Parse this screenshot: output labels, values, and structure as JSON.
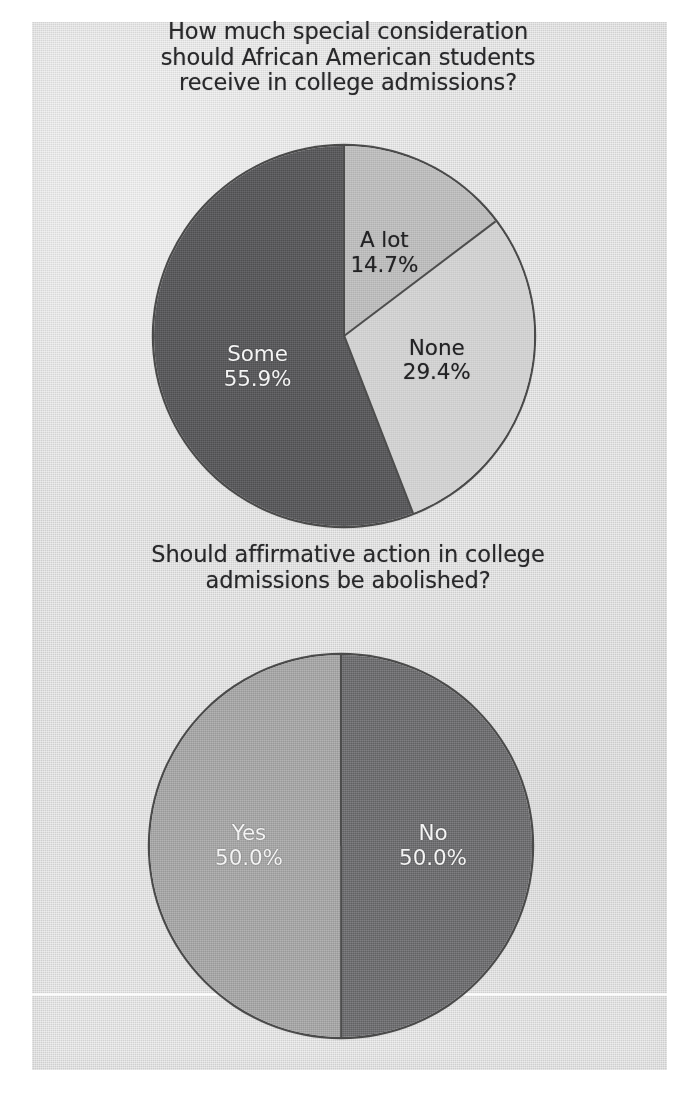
{
  "page": {
    "background_color": "#ffffff",
    "panel_color": "#d9d9d9"
  },
  "chart_data": [
    {
      "type": "pie",
      "id": "college-consideration",
      "title": "How much special consideration\nshould African American students\nreceive in college admissions?",
      "categories": [
        "A lot",
        "None",
        "Some"
      ],
      "values": [
        14.7,
        29.4,
        55.9
      ],
      "value_labels": [
        "14.7%",
        "29.4%",
        "55.9%"
      ],
      "colors": [
        "#b9b9b9",
        "#cfcfcf",
        "#575759"
      ],
      "label_text_colors": [
        "#222224",
        "#222224",
        "#f4f4f4"
      ],
      "start_angle_deg": 0,
      "direction": "clockwise",
      "legend": "none",
      "labels_inside": true,
      "slices": [
        {
          "name": "A lot",
          "value": 14.7,
          "value_label": "14.7%",
          "color": "#b9b9b9"
        },
        {
          "name": "None",
          "value": 29.4,
          "value_label": "29.4%",
          "color": "#cfcfcf"
        },
        {
          "name": "Some",
          "value": 55.9,
          "value_label": "55.9%",
          "color": "#575759"
        }
      ]
    },
    {
      "type": "pie",
      "id": "abolish-affirmative-action",
      "title": "Should affirmative action in college\nadmissions be abolished?",
      "categories": [
        "No",
        "Yes"
      ],
      "values": [
        50.0,
        50.0
      ],
      "value_labels": [
        "50.0%",
        "50.0%"
      ],
      "colors": [
        "#6b6b6d",
        "#a2a2a2"
      ],
      "label_text_colors": [
        "#f4f4f4",
        "#f4f4f4"
      ],
      "start_angle_deg": 0,
      "direction": "clockwise",
      "legend": "none",
      "labels_inside": true,
      "slices": [
        {
          "name": "No",
          "value": 50.0,
          "value_label": "50.0%",
          "color": "#6b6b6d"
        },
        {
          "name": "Yes",
          "value": 50.0,
          "value_label": "50.0%",
          "color": "#a2a2a2"
        }
      ]
    }
  ]
}
